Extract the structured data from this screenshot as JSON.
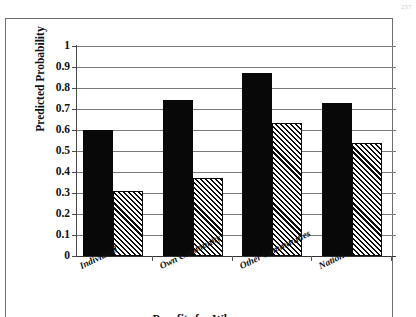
{
  "page": {
    "running_head": "257"
  },
  "chart_data": {
    "type": "bar",
    "title": "",
    "xlabel": "Benefits for Whom",
    "ylabel": "Predicted Probability",
    "categories": [
      "Individual",
      "Own Community",
      "Other Communities",
      "Nation"
    ],
    "series": [
      {
        "name": "series-1-solid-black",
        "style": "solid-black",
        "color": "#080808",
        "values": [
          0.6,
          0.745,
          0.87,
          0.73
        ]
      },
      {
        "name": "series-2-diagonal-hatch",
        "style": "diagonal-hatch",
        "color": "#0a0a0a",
        "values": [
          0.31,
          0.37,
          0.635,
          0.54
        ]
      }
    ],
    "ylim": [
      0,
      1
    ],
    "ytick_labels": [
      "1",
      "0.9",
      "0.8",
      "0.7",
      "0.6",
      "0.5",
      "0.4",
      "0.3",
      "0.2",
      "0.1",
      "0"
    ],
    "ytick_values": [
      1,
      0.9,
      0.8,
      0.7,
      0.6,
      0.5,
      0.4,
      0.3,
      0.2,
      0.1,
      0
    ],
    "grid": true,
    "legend": "none",
    "legend_position": "none"
  }
}
